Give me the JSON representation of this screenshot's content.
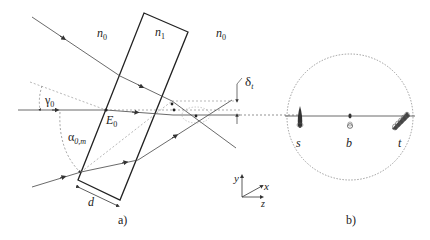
{
  "figure": {
    "panel_a": {
      "caption": "a)",
      "media_left": "n",
      "media_left_sub": "0",
      "media_slab": "n",
      "media_slab_sub": "1",
      "media_right": "n",
      "media_right_sub": "0",
      "angle_gamma": "γ",
      "angle_gamma_sub": "0",
      "angle_alpha": "α",
      "angle_alpha_sub": "0,m",
      "point_E": "E",
      "point_E_sub": "0",
      "thickness": "d",
      "shift": "δ",
      "shift_sub": "t"
    },
    "axes": {
      "y": "y",
      "x": "x",
      "z": "z"
    },
    "panel_b": {
      "caption": "b)",
      "spot_s": "s",
      "spot_b": "b",
      "spot_t": "t"
    }
  },
  "colors": {
    "line": "#333333",
    "dashed": "#777777",
    "slab": "#222222"
  }
}
